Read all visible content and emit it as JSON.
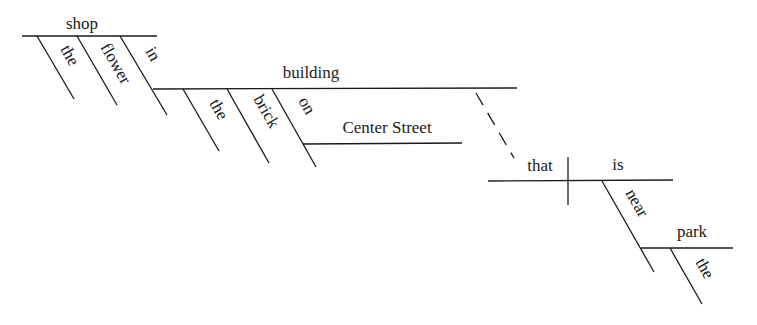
{
  "diagram": {
    "type": "sentence-diagram",
    "words": {
      "shop": "shop",
      "the_1": "the",
      "flower": "flower",
      "in": "in",
      "building": "building",
      "the_2": "the",
      "brick": "brick",
      "on": "on",
      "center_street": "Center Street",
      "that": "that",
      "is": "is",
      "near": "near",
      "park": "park",
      "the_3": "the"
    },
    "relations": [
      {
        "head": "shop",
        "modifier": "the",
        "kind": "modifier"
      },
      {
        "head": "shop",
        "modifier": "flower",
        "kind": "modifier"
      },
      {
        "head": "shop",
        "modifier": "in",
        "kind": "preposition",
        "object": "building"
      },
      {
        "head": "building",
        "modifier": "the",
        "kind": "modifier"
      },
      {
        "head": "building",
        "modifier": "brick",
        "kind": "modifier"
      },
      {
        "head": "building",
        "modifier": "on",
        "kind": "preposition",
        "object": "Center Street"
      },
      {
        "head": "building",
        "modifier": "that is near park",
        "kind": "relative-clause"
      },
      {
        "head": "that",
        "modifier": "is",
        "kind": "subject-predicate"
      },
      {
        "head": "is",
        "modifier": "near",
        "kind": "preposition",
        "object": "park"
      },
      {
        "head": "park",
        "modifier": "the",
        "kind": "modifier"
      }
    ]
  }
}
